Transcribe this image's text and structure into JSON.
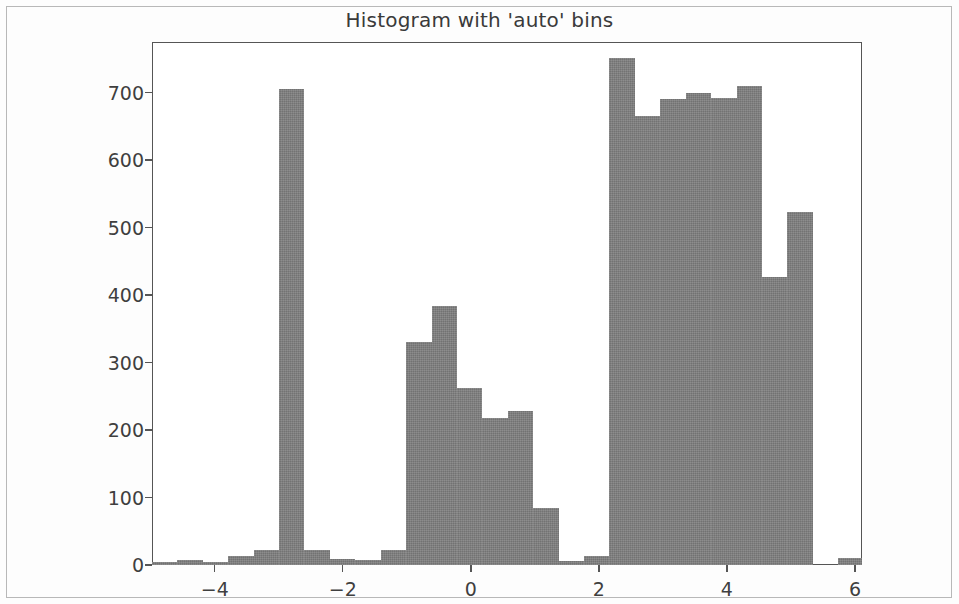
{
  "figure": {
    "title": "Histogram with 'auto' bins",
    "bar_color": "#808080",
    "axis_color": "#555555",
    "background": "#ffffff"
  },
  "chart_data": {
    "type": "bar",
    "title": "Histogram with 'auto' bins",
    "xlabel": "",
    "ylabel": "",
    "xlim": [
      -4.98,
      6.11
    ],
    "ylim": [
      0,
      775
    ],
    "grid": false,
    "legend": null,
    "bin_width": 0.397,
    "xticks": [
      -4,
      -2,
      0,
      2,
      4,
      6
    ],
    "xtick_labels": [
      "−4",
      "−2",
      "0",
      "2",
      "4",
      "6"
    ],
    "yticks": [
      0,
      100,
      200,
      300,
      400,
      500,
      600,
      700
    ],
    "ytick_labels": [
      "0",
      "100",
      "200",
      "300",
      "400",
      "500",
      "600",
      "700"
    ],
    "bin_edges": [
      -4.98,
      -4.583,
      -4.186,
      -3.789,
      -3.392,
      -2.995,
      -2.598,
      -2.201,
      -1.804,
      -1.407,
      -1.01,
      -0.613,
      -0.216,
      0.181,
      0.578,
      0.975,
      1.372,
      1.769,
      2.166,
      2.563,
      2.96,
      3.357,
      3.754,
      4.151,
      4.548,
      4.945,
      5.342,
      5.739,
      6.136
    ],
    "values": [
      4,
      7,
      4,
      13,
      22,
      9,
      8,
      22,
      330,
      384,
      263,
      218,
      228,
      84,
      6,
      13,
      16,
      752,
      665,
      690,
      699,
      692,
      710,
      427,
      523,
      0,
      11,
      0
    ]
  },
  "bars": [
    {
      "label": "bin-1",
      "x0": -4.98,
      "x1": -4.583,
      "value": 4
    },
    {
      "label": "bin-2",
      "x0": -4.583,
      "x1": -4.186,
      "value": 7
    },
    {
      "label": "bin-3",
      "x0": -4.186,
      "x1": -3.789,
      "value": 4
    },
    {
      "label": "bin-4",
      "x0": -3.789,
      "x1": -3.392,
      "value": 13
    },
    {
      "label": "bin-5",
      "x0": -3.392,
      "x1": -2.995,
      "value": 22
    },
    {
      "label": "bin-6",
      "x0": -2.995,
      "x1": -2.598,
      "value": 705
    },
    {
      "label": "bin-7",
      "x0": -2.598,
      "x1": -2.201,
      "value": 22
    },
    {
      "label": "bin-8",
      "x0": -2.201,
      "x1": -1.804,
      "value": 9
    },
    {
      "label": "bin-9",
      "x0": -1.804,
      "x1": -1.407,
      "value": 8
    },
    {
      "label": "bin-10",
      "x0": -1.407,
      "x1": -1.01,
      "value": 22
    },
    {
      "label": "bin-11",
      "x0": -1.01,
      "x1": -0.613,
      "value": 330
    },
    {
      "label": "bin-12",
      "x0": -0.613,
      "x1": -0.216,
      "value": 384
    },
    {
      "label": "bin-13",
      "x0": -0.216,
      "x1": 0.181,
      "value": 263
    },
    {
      "label": "bin-14",
      "x0": 0.181,
      "x1": 0.578,
      "value": 218
    },
    {
      "label": "bin-15",
      "x0": 0.578,
      "x1": 0.975,
      "value": 228
    },
    {
      "label": "bin-16",
      "x0": 0.975,
      "x1": 1.372,
      "value": 84
    },
    {
      "label": "bin-17",
      "x0": 1.372,
      "x1": 1.769,
      "value": 6
    },
    {
      "label": "bin-18",
      "x0": 1.769,
      "x1": 2.166,
      "value": 13
    },
    {
      "label": "bin-19",
      "x0": 2.166,
      "x1": 2.563,
      "value": 752
    },
    {
      "label": "bin-20",
      "x0": 2.563,
      "x1": 2.96,
      "value": 665
    },
    {
      "label": "bin-21",
      "x0": 2.96,
      "x1": 3.357,
      "value": 690
    },
    {
      "label": "bin-22",
      "x0": 3.357,
      "x1": 3.754,
      "value": 699
    },
    {
      "label": "bin-23",
      "x0": 3.754,
      "x1": 4.151,
      "value": 692
    },
    {
      "label": "bin-24",
      "x0": 4.151,
      "x1": 4.548,
      "value": 710
    },
    {
      "label": "bin-25",
      "x0": 4.548,
      "x1": 4.945,
      "value": 427
    },
    {
      "label": "bin-26",
      "x0": 4.945,
      "x1": 5.342,
      "value": 523
    },
    {
      "label": "bin-27",
      "x0": 5.342,
      "x1": 5.739,
      "value": 0
    },
    {
      "label": "bin-28",
      "x0": 5.739,
      "x1": 6.136,
      "value": 11
    }
  ]
}
